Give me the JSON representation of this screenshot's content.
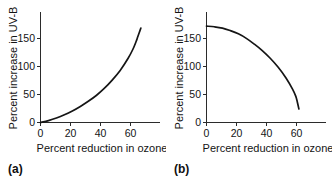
{
  "figure": {
    "background_color": "#ffffff",
    "line_color": "#151515",
    "axis_color": "#2b2b2b",
    "text_color": "#141414"
  },
  "panels": [
    {
      "tag": "(a)",
      "xlabel": "Percent reduction in ozone",
      "ylabel": "Percent increase in UV-B",
      "x_ticks": [
        "0",
        "20",
        "40",
        "60"
      ],
      "y_ticks": [
        "0",
        "50",
        "100",
        "150"
      ]
    },
    {
      "tag": "(b)",
      "xlabel": "Percent reduction in ozone",
      "ylabel": "Percent increase in UV-B",
      "x_ticks": [
        "0",
        "20",
        "40",
        "60"
      ],
      "y_ticks": [
        "0",
        "50",
        "100",
        "150"
      ]
    }
  ],
  "chart_data": [
    {
      "type": "line",
      "panel": "(a)",
      "title": "",
      "xlabel": "Percent reduction in ozone",
      "ylabel": "Percent increase in UV-B",
      "xlim": [
        0,
        75
      ],
      "ylim": [
        0,
        172
      ],
      "xticks": [
        0,
        20,
        40,
        60
      ],
      "yticks": [
        0,
        50,
        100,
        150
      ],
      "grid": false,
      "legend": null,
      "series": [
        {
          "name": "UV-B increase vs ozone reduction (convex)",
          "x": [
            0,
            5,
            10,
            15,
            20,
            25,
            30,
            35,
            40,
            45,
            50,
            55,
            58,
            60,
            61,
            62,
            63
          ],
          "y": [
            0,
            3,
            7,
            12,
            18,
            25,
            33,
            42,
            53,
            66,
            81,
            100,
            114,
            126,
            133,
            140,
            147
          ]
        }
      ]
    },
    {
      "type": "line",
      "panel": "(b)",
      "title": "",
      "xlabel": "Percent reduction in ozone",
      "ylabel": "Percent increase in UV-B",
      "xlim": [
        0,
        75
      ],
      "ylim": [
        0,
        172
      ],
      "xticks": [
        0,
        20,
        40,
        60
      ],
      "yticks": [
        0,
        50,
        100,
        150
      ],
      "grid": false,
      "legend": null,
      "series": [
        {
          "name": "UV-B increase vs ozone reduction (concave decreasing)",
          "x": [
            0,
            5,
            10,
            15,
            20,
            25,
            30,
            35,
            40,
            45,
            50,
            54,
            56,
            57,
            58
          ],
          "y": [
            150,
            149,
            147,
            143,
            138,
            131,
            122,
            112,
            100,
            86,
            69,
            52,
            41,
            32,
            21
          ]
        }
      ]
    }
  ]
}
